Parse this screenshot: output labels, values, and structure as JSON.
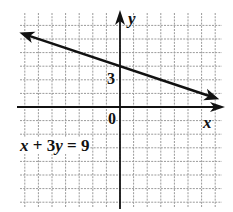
{
  "chart_data": {
    "type": "line",
    "title": "",
    "equation": "x + 3y = 9",
    "xlabel": "x",
    "ylabel": "y",
    "tick_labels": {
      "origin": "0",
      "y_intercept_label": "3"
    },
    "grid": true,
    "xlim": [
      -7.5,
      7.5
    ],
    "ylim": [
      -7.5,
      7
    ],
    "series": [
      {
        "name": "x + 3y = 9",
        "points": [
          [
            -7.4,
            5.47
          ],
          [
            -6,
            5
          ],
          [
            0,
            3
          ],
          [
            3,
            2
          ],
          [
            6,
            1
          ],
          [
            7.3,
            0.57
          ]
        ],
        "arrows_both_ends": true
      }
    ],
    "colors": {
      "line": "#111111",
      "grid": "#9a9a9a",
      "axis": "#111111",
      "background": "#ffffff"
    }
  },
  "labels": {
    "x_axis": "x",
    "y_axis": "y",
    "origin": "0",
    "three": "3",
    "equation_parts": {
      "x": "x",
      "plus": " + 3",
      "y": "y",
      "eq": " = 9"
    }
  }
}
